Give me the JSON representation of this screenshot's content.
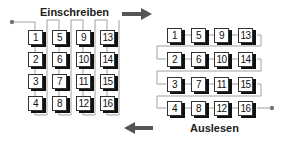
{
  "write_section": {
    "title": "Einschreiben",
    "order": "column-wise",
    "columns": [
      [
        "1",
        "2",
        "3",
        "4"
      ],
      [
        "5",
        "6",
        "7",
        "8"
      ],
      [
        "9",
        "10",
        "11",
        "12"
      ],
      [
        "13",
        "14",
        "15",
        "16"
      ]
    ]
  },
  "read_section": {
    "title": "Auslesen",
    "order": "row-wise",
    "rows": [
      [
        "1",
        "5",
        "9",
        "13"
      ],
      [
        "2",
        "6",
        "10",
        "14"
      ],
      [
        "3",
        "7",
        "11",
        "15"
      ],
      [
        "4",
        "8",
        "12",
        "16"
      ]
    ]
  },
  "arrows": {
    "top": {
      "direction": "right"
    },
    "bottom": {
      "direction": "left"
    }
  },
  "colors": {
    "line": "#8a8a8a",
    "arrow": "#555555",
    "box_border": "#333333",
    "shadow": "#111111",
    "dot": "#777777"
  }
}
